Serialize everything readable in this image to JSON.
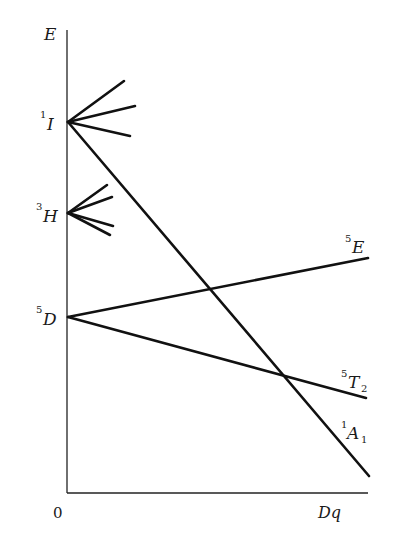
{
  "diagram": {
    "type": "energy-level correlation diagram",
    "axes": {
      "y_label": "E",
      "x_origin_label": "0",
      "x_end_label": "Dq"
    },
    "free_ion_terms": [
      {
        "id": "1I",
        "multiplicity": "1",
        "symbol": "I",
        "subscript": ""
      },
      {
        "id": "3H",
        "multiplicity": "3",
        "symbol": "H",
        "subscript": ""
      },
      {
        "id": "5D",
        "multiplicity": "5",
        "symbol": "D",
        "subscript": ""
      }
    ],
    "field_terms": [
      {
        "id": "5E",
        "multiplicity": "5",
        "symbol": "E",
        "subscript": "",
        "from": "5D",
        "trend": "rising"
      },
      {
        "id": "5T2",
        "multiplicity": "5",
        "symbol": "T",
        "subscript": "2",
        "from": "5D",
        "trend": "falling"
      },
      {
        "id": "1A1",
        "multiplicity": "1",
        "symbol": "A",
        "subscript": "1",
        "from": "1I",
        "trend": "falling steeply"
      }
    ],
    "line_color": "#111111"
  }
}
